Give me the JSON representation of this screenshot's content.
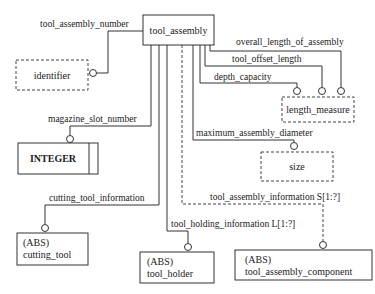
{
  "diagram": {
    "type": "EXPRESS-G entity diagram",
    "entities": {
      "tool_assembly": {
        "name": "tool_assembly",
        "kind": "entity"
      },
      "identifier": {
        "name": "identifier",
        "kind": "defined_type"
      },
      "length_measure": {
        "name": "length_measure",
        "kind": "defined_type"
      },
      "size": {
        "name": "size",
        "kind": "defined_type"
      },
      "integer": {
        "name": "INTEGER",
        "kind": "simple_type"
      },
      "cutting_tool": {
        "abs": "(ABS)",
        "name": "cutting_tool",
        "kind": "abstract_entity"
      },
      "tool_holder": {
        "abs": "(ABS)",
        "name": "tool_holder",
        "kind": "abstract_entity"
      },
      "tool_assembly_component": {
        "abs": "(ABS)",
        "name": "tool_assembly_component",
        "kind": "abstract_entity"
      }
    },
    "relations": {
      "tool_assembly_number": "tool_assembly_number",
      "overall_length_of_assembly": "overall_length_of_assembly",
      "tool_offset_length": "tool_offset_length",
      "depth_capacity": "depth_capacity",
      "magazine_slot_number": "magazine_slot_number",
      "maximum_assembly_diameter": "maximum_assembly_diameter",
      "tool_assembly_information": "tool_assembly_information S[1:?]",
      "cutting_tool_information": "cutting_tool_information",
      "tool_holding_information": "tool_holding_information L[1:?]"
    }
  }
}
